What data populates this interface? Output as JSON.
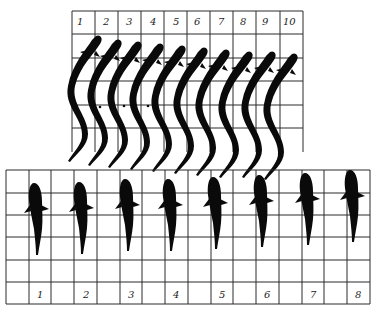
{
  "figure": {
    "top_panel": {
      "description": "Serpentine (anguilliform) swimming sequence, side-by-side frames",
      "frame_labels": [
        "1",
        "2",
        "3",
        "4",
        "5",
        "6",
        "7",
        "8",
        "9",
        "10"
      ],
      "grid": {
        "columns": 10,
        "rows": 6
      }
    },
    "bottom_panel": {
      "description": "Dorsal-view swimming sequence of a fish",
      "frame_labels": [
        "1",
        "2",
        "3",
        "4",
        "5",
        "6",
        "7",
        "8"
      ],
      "grid": {
        "columns": 16,
        "rows": 6
      }
    },
    "colors": {
      "ink": "#0a0a0a",
      "grid": "#2a2a2a",
      "background": "#ffffff"
    }
  }
}
